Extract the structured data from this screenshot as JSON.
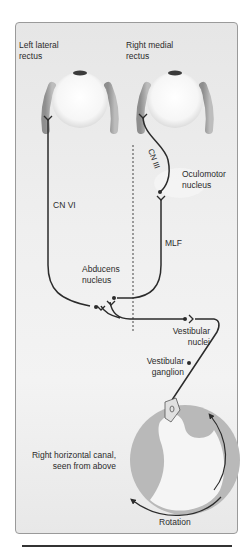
{
  "figure": {
    "labels": {
      "left_lateral_rectus": [
        "Left lateral",
        "rectus"
      ],
      "right_medial_rectus": [
        "Right medial",
        "rectus"
      ],
      "cn_iii": "CN III",
      "oculomotor_nucleus": [
        "Oculomotor",
        "nucleus"
      ],
      "cn_vi": "CN VI",
      "mlf": "MLF",
      "abducens_nucleus": [
        "Abducens",
        "nucleus"
      ],
      "vestibular_nuclei": [
        "Vestibular",
        "nuclei"
      ],
      "vestibular_ganglion": [
        "Vestibular",
        "ganglion"
      ],
      "horizontal_canal": [
        "Right horizontal canal,",
        "seen from above"
      ],
      "rotation": "Rotation"
    },
    "colors": {
      "panel_border": "#9a9a9a",
      "nerve": "#2b2b2b",
      "muscle": "#9c9c9c",
      "eyeball": "#f7f7f7",
      "canal": "#b5b5b5",
      "midline": "#444444"
    }
  }
}
